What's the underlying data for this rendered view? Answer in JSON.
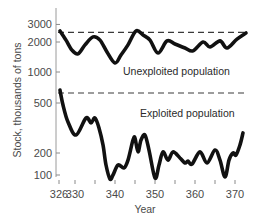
{
  "chart_data": {
    "type": "line",
    "title": "",
    "xlabel": "Year",
    "ylabel": "Stock, thousands of tons",
    "yscale": "log",
    "xlim": [
      326,
      373
    ],
    "x_ticks": [
      326,
      330,
      335,
      340,
      345,
      350,
      355,
      360,
      365,
      370
    ],
    "x_tick_labels": [
      "326",
      "330",
      "",
      "340",
      "",
      "350",
      "",
      "360",
      "",
      "370"
    ],
    "y_ticks_upper": [
      3000,
      2000,
      1000
    ],
    "y_ticks_lower": [
      500,
      200,
      100
    ],
    "grid": false,
    "legend": "inline labels",
    "series": [
      {
        "name": "Unexploited population",
        "reference_level": 2500,
        "x": [
          326.25,
          327.75,
          329.25,
          330.75,
          332.5,
          334.5,
          336.25,
          338,
          340,
          341.5,
          343.25,
          345.25,
          347,
          348.75,
          350.75,
          353,
          355,
          357.5,
          359.5,
          362,
          363.75,
          366.25,
          368,
          370.5,
          372.75
        ],
        "values": [
          2580,
          2090,
          1660,
          1520,
          1870,
          2250,
          2090,
          1590,
          1230,
          1480,
          1870,
          2580,
          2350,
          2090,
          1550,
          2050,
          1910,
          1740,
          1630,
          2000,
          1780,
          2050,
          1740,
          2140,
          2460
        ]
      },
      {
        "name": "Exploited population",
        "reference_level": 600,
        "x": [
          326.25,
          327,
          328.25,
          330.25,
          332.75,
          334,
          335,
          336,
          337,
          337.75,
          338.75,
          339.5,
          340.75,
          342.25,
          343.25,
          344.5,
          345,
          345.75,
          346.5,
          347.5,
          348.5,
          350,
          351,
          352,
          353.25,
          354.5,
          356.25,
          357.5,
          358.25,
          359.25,
          361.25,
          363,
          365,
          366.25,
          367.5,
          368.5,
          369.5,
          370.25,
          371.25,
          372
        ],
        "values": [
          634,
          482,
          353,
          278,
          380,
          347,
          380,
          316,
          232,
          137,
          88,
          100,
          137,
          125,
          160,
          254,
          263,
          204,
          254,
          278,
          211,
          91,
          137,
          204,
          160,
          204,
          171,
          146,
          155,
          141,
          204,
          146,
          211,
          160,
          94,
          160,
          200,
          188,
          232,
          289
        ]
      }
    ]
  },
  "labels": {
    "y_axis_title": "Stock, thousands of tons",
    "x_axis_title": "Year",
    "unexploited": "Unexploited population",
    "exploited": "Exploited population"
  }
}
